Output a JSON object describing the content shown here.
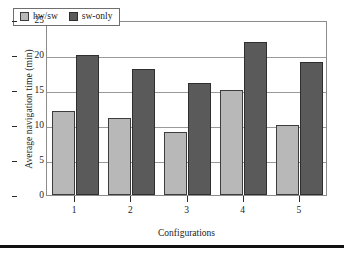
{
  "chart_data": {
    "type": "bar",
    "title": "",
    "xlabel": "Configurations",
    "ylabel": "Average navigation time (min)",
    "categories": [
      "1",
      "2",
      "3",
      "4",
      "5"
    ],
    "series": [
      {
        "name": "hw/sw",
        "color": "#b8b8b8",
        "values": [
          12,
          11,
          9,
          15,
          10
        ]
      },
      {
        "name": "sw-only",
        "color": "#5a5a5a",
        "values": [
          20,
          18,
          16,
          21.8,
          19
        ]
      }
    ],
    "ylim": [
      0,
      25
    ],
    "yticks": [
      0,
      5,
      10,
      15,
      20,
      25
    ],
    "ytick_labels": [
      "0",
      "5",
      "10",
      "15",
      "20",
      "25"
    ],
    "grid": "horizontal",
    "legend_position": "top-left"
  }
}
